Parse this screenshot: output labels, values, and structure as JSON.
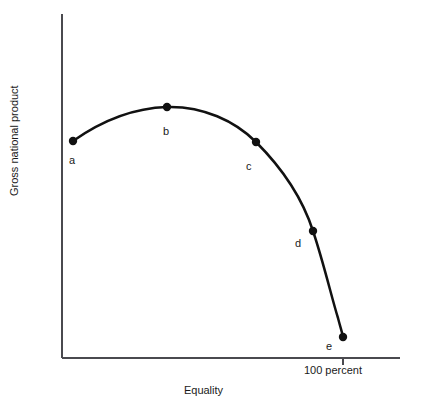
{
  "figure": {
    "background_color": "#ffffff",
    "ink_color": "#111111",
    "axis_color": "#4a4a4f",
    "header_artifact": "",
    "axes": {
      "y_axis_label": "Gross national product",
      "x_axis_label": "Equality",
      "x_tick_labels": [
        "100 percent"
      ]
    },
    "point_labels": {
      "a": "a",
      "b": "b",
      "c": "c",
      "d": "d",
      "e": "e"
    }
  },
  "chart_data": {
    "type": "line",
    "title": "",
    "subtitle": "",
    "xlabel": "Equality",
    "ylabel": "Gross national product",
    "grid": false,
    "legend": null,
    "axis_ticks_x": [
      {
        "label": "100 percent",
        "value": 100
      }
    ],
    "axis_ticks_y": [],
    "xlim": [
      0,
      118
    ],
    "ylim": [
      0,
      100
    ],
    "curve_description": "Inverted-U tradeoff curve rising from a to a peak at b, then falling with increasing steepness through c and d to e at the horizontal axis.",
    "series": [
      {
        "name": "Equality-efficiency tradeoff curve",
        "points": [
          {
            "label": "a",
            "x": 3,
            "y": 63,
            "px": 73,
            "py": 141,
            "label_dx": -4,
            "label_dy": 14
          },
          {
            "label": "b",
            "x": 31,
            "y": 73,
            "px": 167,
            "py": 107,
            "label_dx": -4,
            "label_dy": 19
          },
          {
            "label": "c",
            "x": 58,
            "y": 63,
            "px": 256,
            "py": 142,
            "label_dx": -10,
            "label_dy": 19
          },
          {
            "label": "d",
            "x": 75,
            "y": 37,
            "px": 313,
            "py": 231,
            "label_dx": -18,
            "label_dy": 7
          },
          {
            "label": "e",
            "x": 84,
            "y": 6,
            "px": 343,
            "py": 337,
            "label_dx": -17,
            "label_dy": 4
          }
        ]
      }
    ],
    "curve_path": "M 73,141 C 100,122 133,108 167,107 C 203,106 235,121 256,142 C 283,169 303,200 313,231 C 324,264 332,299 338,318 C 340,326 342,332 343,337",
    "geometry": {
      "y_axis_x": 62,
      "y_axis_top": 14,
      "x_axis_y": 358,
      "x_axis_right": 400,
      "tick_x_100percent": 343,
      "tick_length": 7,
      "point_radius": 4.2
    }
  }
}
